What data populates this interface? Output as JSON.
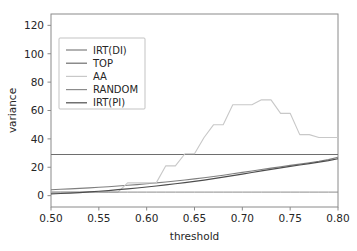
{
  "chart_data": {
    "type": "line",
    "title": "",
    "xlabel": "threshold",
    "ylabel": "variance",
    "xlim": [
      0.5,
      0.8
    ],
    "ylim": [
      -8,
      128
    ],
    "xticks": [
      0.5,
      0.55,
      0.6,
      0.65,
      0.7,
      0.75,
      0.8
    ],
    "xtick_labels": [
      "0.50",
      "0.55",
      "0.60",
      "0.65",
      "0.70",
      "0.75",
      "0.80"
    ],
    "yticks": [
      0,
      20,
      40,
      60,
      80,
      100,
      120
    ],
    "ytick_labels": [
      "0",
      "20",
      "40",
      "60",
      "80",
      "100",
      "120"
    ],
    "grid": false,
    "legend_position": "upper-left",
    "x": [
      0.5,
      0.51,
      0.52,
      0.53,
      0.54,
      0.55,
      0.56,
      0.57,
      0.58,
      0.59,
      0.6,
      0.61,
      0.62,
      0.63,
      0.64,
      0.65,
      0.66,
      0.67,
      0.68,
      0.69,
      0.7,
      0.71,
      0.72,
      0.73,
      0.74,
      0.75,
      0.76,
      0.77,
      0.78,
      0.79,
      0.8
    ],
    "series": [
      {
        "name": "IRT(DI)",
        "color": "#7f7f7f",
        "width": 1.1,
        "values": [
          4.2,
          4.5,
          4.8,
          5.1,
          5.5,
          5.9,
          6.3,
          6.8,
          7.3,
          7.8,
          8.4,
          9.0,
          9.6,
          10.3,
          11.0,
          11.8,
          12.6,
          13.5,
          14.4,
          15.4,
          16.4,
          17.4,
          18.4,
          19.4,
          20.4,
          21.3,
          22.2,
          23.2,
          24.2,
          25.4,
          27.0
        ]
      },
      {
        "name": "TOP",
        "color": "#6e6e6e",
        "width": 1.1,
        "values": [
          29.0,
          29.0,
          29.0,
          29.0,
          29.0,
          29.0,
          29.0,
          29.0,
          29.0,
          29.0,
          29.0,
          29.0,
          29.0,
          29.0,
          29.0,
          29.0,
          29.0,
          29.0,
          29.0,
          29.0,
          29.0,
          29.0,
          29.0,
          29.0,
          29.0,
          29.0,
          29.0,
          29.0,
          29.0,
          29.0,
          29.0
        ]
      },
      {
        "name": "AA",
        "color": "#c8c8c8",
        "width": 1.1,
        "values": [
          2.5,
          2.5,
          2.5,
          2.5,
          2.5,
          2.5,
          2.5,
          2.5,
          9.0,
          9.0,
          9.0,
          9.0,
          21.0,
          21.0,
          29.5,
          29.5,
          41.0,
          50.0,
          50.0,
          64.0,
          64.0,
          64.0,
          67.5,
          67.5,
          58.0,
          58.0,
          43.0,
          43.0,
          41.0,
          41.0,
          41.0
        ]
      },
      {
        "name": "RANDOM",
        "color": "#8c8c8c",
        "width": 1.0,
        "values": [
          2.5,
          2.5,
          2.5,
          2.5,
          2.5,
          2.5,
          2.5,
          2.5,
          2.5,
          2.5,
          2.5,
          2.5,
          2.5,
          2.5,
          2.5,
          2.5,
          2.5,
          2.5,
          2.5,
          2.5,
          2.5,
          2.5,
          2.5,
          2.5,
          2.5,
          2.5,
          2.5,
          2.5,
          2.5,
          2.5,
          2.5
        ]
      },
      {
        "name": "IRT(PI)",
        "color": "#4d4d4d",
        "width": 1.2,
        "values": [
          1.2,
          1.5,
          1.8,
          2.2,
          2.6,
          3.1,
          3.6,
          4.2,
          4.8,
          5.4,
          6.1,
          6.8,
          7.6,
          8.4,
          9.2,
          10.1,
          11.0,
          12.0,
          13.0,
          14.1,
          15.2,
          16.3,
          17.4,
          18.5,
          19.6,
          20.6,
          21.6,
          22.6,
          23.6,
          24.7,
          26.0
        ]
      }
    ]
  },
  "axes": {
    "xlabel": "threshold",
    "ylabel": "variance"
  },
  "legend": {
    "entries": [
      {
        "label": "IRT(DI)"
      },
      {
        "label": "TOP"
      },
      {
        "label": "AA"
      },
      {
        "label": "RANDOM"
      },
      {
        "label": "IRT(PI)"
      }
    ]
  }
}
